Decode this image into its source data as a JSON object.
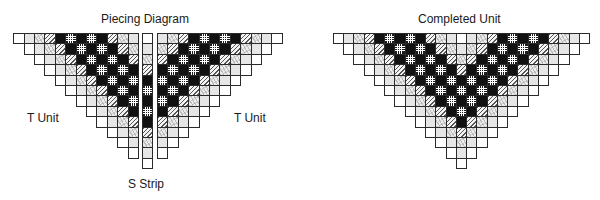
{
  "titles": {
    "piecing": "Piecing Diagram",
    "completed": "Completed Unit"
  },
  "labels": {
    "t_unit_left": "T Unit",
    "t_unit_right": "T Unit",
    "s_strip": "S Strip"
  },
  "legend_fabric_codes": {
    "W": "white",
    "L": "light gray",
    "S": "gray swirl print",
    "H": "diagonal hatch",
    "B": "solid black",
    "C": "black with white grid check"
  },
  "pattern": {
    "t_unit_row1": [
      "W",
      "L",
      "S",
      "H",
      "B",
      "C",
      "B",
      "C",
      "B",
      "H",
      "S",
      "L"
    ],
    "s_strip": [
      "W",
      "L",
      "S",
      "H",
      "B",
      "C",
      "B",
      "C",
      "B",
      "H",
      "S",
      "L",
      "W"
    ],
    "rows": 12,
    "completed_rows": 13
  },
  "colors": {
    "outline": "#2a2a2a",
    "black": "#111111",
    "light": "#e6e6e6"
  }
}
